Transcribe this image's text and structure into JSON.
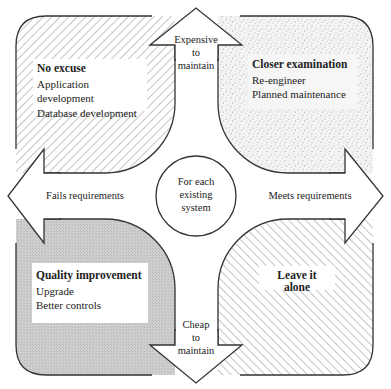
{
  "diagram": {
    "center": {
      "label_lines": [
        "For each",
        "existing",
        "system"
      ]
    },
    "axes": {
      "up": {
        "label_lines": [
          "Expensive",
          "to",
          "maintain"
        ]
      },
      "down": {
        "label_lines": [
          "Cheap",
          "to",
          "maintain"
        ]
      },
      "left": {
        "label": "Fails requirements"
      },
      "right": {
        "label": "Meets requirements"
      }
    },
    "quadrants": {
      "top_left": {
        "title": "No excuse",
        "items": [
          "Application development",
          "Database development"
        ],
        "fill": "diagonal-hatch"
      },
      "top_right": {
        "title": "Closer examination",
        "items": [
          "Re-engineer",
          "Planned maintenance"
        ],
        "fill": "stipple"
      },
      "bottom_left": {
        "title": "Quality improvement",
        "items": [
          "Upgrade",
          "Better controls"
        ],
        "fill": "gray"
      },
      "bottom_right": {
        "title": "Leave it alone",
        "items": [],
        "fill": "back-diagonal-hatch"
      }
    },
    "colors": {
      "stroke": "#333333",
      "gray_fill": "#c9c9c9",
      "hatch": "#8a8a8a",
      "stipple": "#9a9a9a"
    }
  }
}
